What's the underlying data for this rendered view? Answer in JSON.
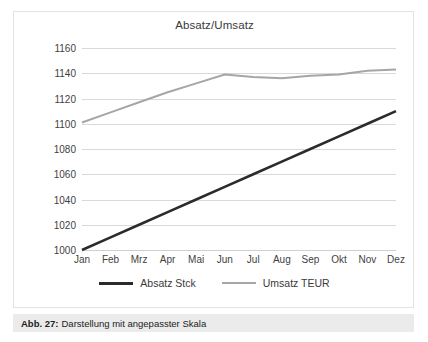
{
  "figure": {
    "caption_number": "Abb. 27:",
    "caption_text": "Darstellung mit angepasster Skala"
  },
  "colors": {
    "series_absatz": "#2b2b2b",
    "series_umsatz": "#a6a6a6",
    "gridline": "#d9d9d9",
    "tick_text": "#3f3f3f",
    "title_text": "#3a3a3a",
    "caption_bar_bg": "#ebebeb",
    "card_border": "#e3e3e3",
    "background": "#ffffff"
  },
  "chart_data": {
    "type": "line",
    "title": "Absatz/Umsatz",
    "xlabel": "",
    "ylabel": "",
    "ylim": [
      1000,
      1160
    ],
    "ytick_step": 20,
    "ytick_labels": [
      "1160",
      "1140",
      "1120",
      "1100",
      "1080",
      "1060",
      "1040",
      "1020",
      "1000"
    ],
    "ytick_values": [
      1160,
      1140,
      1120,
      1100,
      1080,
      1060,
      1040,
      1020,
      1000
    ],
    "grid": true,
    "legend_position": "bottom",
    "categories": [
      "Jan",
      "Feb",
      "Mrz",
      "Apr",
      "Mai",
      "Jun",
      "Jul",
      "Aug",
      "Sep",
      "Okt",
      "Nov",
      "Dez"
    ],
    "series": [
      {
        "name": "Absatz Stck",
        "color": "#2b2b2b",
        "width": 2.6,
        "values": [
          1000,
          1010,
          1020,
          1030,
          1040,
          1050,
          1060,
          1070,
          1080,
          1090,
          1100,
          1110
        ]
      },
      {
        "name": "Umsatz TEUR",
        "color": "#a6a6a6",
        "width": 2.0,
        "values": [
          1101,
          1109,
          1117,
          1125,
          1132,
          1139,
          1137,
          1136,
          1138,
          1139,
          1142,
          1143
        ]
      }
    ]
  },
  "legend": {
    "items": [
      {
        "label": "Absatz Stck",
        "color": "#2b2b2b",
        "thickness": "thick"
      },
      {
        "label": "Umsatz TEUR",
        "color": "#a6a6a6",
        "thickness": "thin"
      }
    ]
  }
}
